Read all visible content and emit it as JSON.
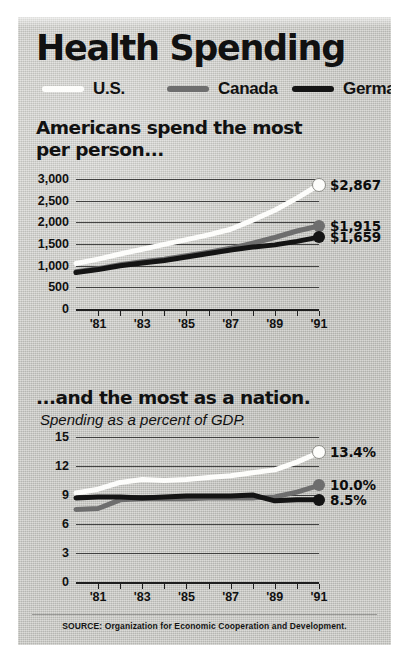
{
  "title": "Health Spending",
  "watermark": "",
  "legend": [
    {
      "label": "U.S.",
      "color": "#fdfdfb",
      "key": "us"
    },
    {
      "label": "Canada",
      "color": "#6e6e6e",
      "key": "ca"
    },
    {
      "label": "Germany",
      "color": "#141414",
      "key": "de"
    }
  ],
  "source": "SOURCE: Organization for Economic Cooperation and Development.",
  "chart_data": [
    {
      "type": "line",
      "title": "Americans spend the most\nper person...",
      "subtitle": "",
      "xlabel": "",
      "ylabel": "",
      "ylim": [
        0,
        3000
      ],
      "yticks": [
        0,
        500,
        1000,
        1500,
        2000,
        2500,
        3000
      ],
      "ytick_labels": [
        "0",
        "500",
        "1,000",
        "1,500",
        "2,000",
        "2,500",
        "3,000"
      ],
      "grid": true,
      "legend_position": "top",
      "x": [
        1980,
        1981,
        1982,
        1983,
        1984,
        1985,
        1986,
        1987,
        1988,
        1989,
        1990,
        1991
      ],
      "xtick_labels": [
        "'81",
        "'83",
        "'85",
        "'87",
        "'89",
        "'91"
      ],
      "xtick_values": [
        1981,
        1983,
        1985,
        1987,
        1989,
        1991
      ],
      "series": [
        {
          "name": "U.S.",
          "color": "#fdfdfb",
          "values": [
            1050,
            1150,
            1270,
            1380,
            1490,
            1600,
            1710,
            1840,
            2050,
            2280,
            2560,
            2867
          ],
          "end_label": "$2,867"
        },
        {
          "name": "Canada",
          "color": "#6e6e6e",
          "values": [
            860,
            930,
            1020,
            1090,
            1150,
            1230,
            1310,
            1400,
            1520,
            1650,
            1800,
            1915
          ],
          "end_label": "$1,915"
        },
        {
          "name": "Germany",
          "color": "#141414",
          "values": [
            840,
            910,
            1000,
            1060,
            1120,
            1200,
            1280,
            1360,
            1430,
            1480,
            1560,
            1659
          ],
          "end_label": "$1,659"
        }
      ]
    },
    {
      "type": "line",
      "title": "...and the most as a nation.",
      "subtitle": "Spending as a percent of GDP.",
      "xlabel": "",
      "ylabel": "",
      "ylim": [
        0,
        15
      ],
      "yticks": [
        0,
        3,
        6,
        9,
        12,
        15
      ],
      "ytick_labels": [
        "0",
        "3",
        "6",
        "9",
        "12",
        "15"
      ],
      "grid": true,
      "legend_position": "top",
      "x": [
        1980,
        1981,
        1982,
        1983,
        1984,
        1985,
        1986,
        1987,
        1988,
        1989,
        1990,
        1991
      ],
      "xtick_labels": [
        "'81",
        "'83",
        "'85",
        "'87",
        "'89",
        "'91"
      ],
      "xtick_values": [
        1981,
        1983,
        1985,
        1987,
        1989,
        1991
      ],
      "series": [
        {
          "name": "U.S.",
          "color": "#fdfdfb",
          "values": [
            9.2,
            9.6,
            10.3,
            10.6,
            10.5,
            10.6,
            10.8,
            11.0,
            11.3,
            11.6,
            12.4,
            13.4
          ],
          "end_label": "13.4%"
        },
        {
          "name": "Canada",
          "color": "#6e6e6e",
          "values": [
            7.5,
            7.6,
            8.5,
            8.6,
            8.6,
            8.6,
            8.7,
            8.7,
            8.7,
            8.8,
            9.3,
            10.0
          ],
          "end_label": "10.0%"
        },
        {
          "name": "Germany",
          "color": "#141414",
          "values": [
            8.7,
            8.8,
            8.8,
            8.7,
            8.8,
            8.9,
            8.9,
            8.9,
            9.0,
            8.4,
            8.5,
            8.5
          ],
          "end_label": "8.5%"
        }
      ]
    }
  ]
}
